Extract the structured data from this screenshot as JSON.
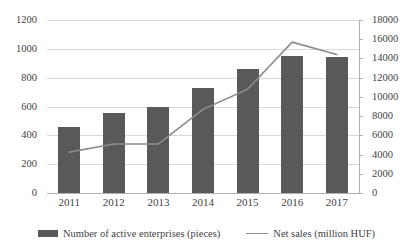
{
  "chart_data": {
    "type": "bar",
    "title": "",
    "subtitle": "",
    "xlabel": "",
    "ylabel": "",
    "categories": [
      "2011",
      "2012",
      "2013",
      "2014",
      "2015",
      "2016",
      "2017"
    ],
    "grid": true,
    "legend_position": "bottom",
    "axes": {
      "left": {
        "label": "",
        "ylim": [
          0,
          1200
        ],
        "step": 200,
        "ticks": [
          "0",
          "200",
          "400",
          "600",
          "800",
          "1000",
          "1200"
        ],
        "tick_values": [
          0,
          200,
          400,
          600,
          800,
          1000,
          1200
        ]
      },
      "right": {
        "label": "",
        "ylim": [
          0,
          18000
        ],
        "step": 2000,
        "ticks": [
          "0",
          "2000",
          "4000",
          "6000",
          "8000",
          "10000",
          "12000",
          "14000",
          "16000",
          "18000"
        ],
        "tick_values": [
          0,
          2000,
          4000,
          6000,
          8000,
          10000,
          12000,
          14000,
          16000,
          18000
        ]
      }
    },
    "series": [
      {
        "name": "Number of active enterprises (pieces)",
        "type": "bar",
        "axis": "left",
        "color": "#595959",
        "values": [
          460,
          555,
          600,
          725,
          860,
          950,
          945
        ]
      },
      {
        "name": "Net sales (million HUF)",
        "type": "line",
        "axis": "right",
        "color": "#8c8c8c",
        "values": [
          4250,
          5100,
          5100,
          8700,
          10800,
          15700,
          14400
        ]
      }
    ]
  },
  "legend": {
    "items": [
      {
        "label": "Number of active enterprises (pieces)",
        "marker": "bar-swatch"
      },
      {
        "label": "Net sales (million HUF)",
        "marker": "line-swatch"
      }
    ]
  }
}
